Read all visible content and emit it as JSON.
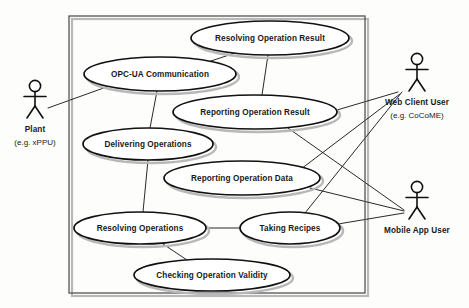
{
  "diagram": {
    "type": "uml-use-case-diagram",
    "background_color": "#fdfdfc",
    "stroke_color": "#111111",
    "shadow_color": "#b8b8b8",
    "system_boundary": {
      "x": 69,
      "y": 16,
      "width": 296,
      "height": 277
    },
    "use_cases": [
      {
        "id": "resolving-operation-result",
        "label": "Resolving Operation Result",
        "cx": 270,
        "cy": 38,
        "rx": 79,
        "ry": 17
      },
      {
        "id": "opc-ua-communication",
        "label": "OPC-UA Communication",
        "cx": 160,
        "cy": 74,
        "rx": 76,
        "ry": 17
      },
      {
        "id": "reporting-operation-result",
        "label": "Reporting Operation Result",
        "cx": 255,
        "cy": 112,
        "rx": 82,
        "ry": 17
      },
      {
        "id": "delivering-operations",
        "label": "Delivering Operations",
        "cx": 148,
        "cy": 144,
        "rx": 65,
        "ry": 16
      },
      {
        "id": "reporting-operation-data",
        "label": "Reporting Operation Data",
        "cx": 242,
        "cy": 178,
        "rx": 78,
        "ry": 17
      },
      {
        "id": "resolving-operations",
        "label": "Resolving Operations",
        "cx": 140,
        "cy": 228,
        "rx": 66,
        "ry": 16
      },
      {
        "id": "taking-recipes",
        "label": "Taking Recipes",
        "cx": 290,
        "cy": 228,
        "rx": 50,
        "ry": 16
      },
      {
        "id": "checking-operation-validity",
        "label": "Checking Operation Validity",
        "cx": 212,
        "cy": 275,
        "rx": 78,
        "ry": 16
      }
    ],
    "actors": [
      {
        "id": "plant",
        "label": "Plant",
        "sublabel": "(e.g. xPPU)",
        "x": 35,
        "y": 95,
        "label_y": 125,
        "sublabel_y": 138
      },
      {
        "id": "web-client-user",
        "label": "Web Client User",
        "sublabel": "(e.g. CoCoME)",
        "x": 417,
        "y": 68,
        "label_y": 98,
        "sublabel_y": 111
      },
      {
        "id": "mobile-app-user",
        "label": "Mobile App User",
        "sublabel": "",
        "x": 417,
        "y": 196,
        "label_y": 226,
        "sublabel_y": 0
      }
    ],
    "associations": [
      {
        "from": "plant",
        "to": "opc-ua-communication",
        "x1": 48,
        "y1": 108,
        "x2": 112,
        "y2": 85
      },
      {
        "from": "opc-ua-communication",
        "to": "resolving-operation-result",
        "x1": 208,
        "y1": 62,
        "x2": 238,
        "y2": 52
      },
      {
        "from": "opc-ua-communication",
        "to": "delivering-operations",
        "x1": 157,
        "y1": 91,
        "x2": 150,
        "y2": 128
      },
      {
        "from": "resolving-operation-result",
        "to": "reporting-operation-result",
        "x1": 268,
        "y1": 55,
        "x2": 262,
        "y2": 95
      },
      {
        "from": "delivering-operations",
        "to": "resolving-operations",
        "x1": 148,
        "y1": 160,
        "x2": 143,
        "y2": 212
      },
      {
        "from": "resolving-operations",
        "to": "taking-recipes",
        "x1": 206,
        "y1": 228,
        "x2": 240,
        "y2": 228
      },
      {
        "from": "resolving-operations",
        "to": "checking-operation-validity",
        "x1": 160,
        "y1": 242,
        "x2": 190,
        "y2": 262
      },
      {
        "from": "web-client-user",
        "to": "reporting-operation-result",
        "x1": 398,
        "y1": 92,
        "x2": 337,
        "y2": 110
      },
      {
        "from": "web-client-user",
        "to": "taking-recipes",
        "x1": 402,
        "y1": 92,
        "x2": 305,
        "y2": 213
      },
      {
        "from": "web-client-user",
        "to": "reporting-operation-data",
        "x1": 400,
        "y1": 94,
        "x2": 268,
        "y2": 194
      },
      {
        "from": "mobile-app-user",
        "to": "reporting-operation-result",
        "x1": 404,
        "y1": 210,
        "x2": 288,
        "y2": 128
      },
      {
        "from": "mobile-app-user",
        "to": "reporting-operation-data",
        "x1": 404,
        "y1": 211,
        "x2": 310,
        "y2": 188
      },
      {
        "from": "mobile-app-user",
        "to": "taking-recipes",
        "x1": 404,
        "y1": 213,
        "x2": 338,
        "y2": 224
      }
    ]
  }
}
